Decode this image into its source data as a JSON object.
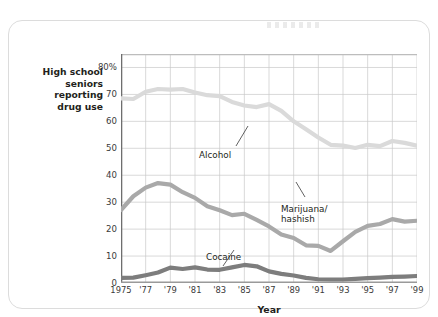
{
  "figure": {
    "y_axis_caption_lines": [
      "High school",
      "seniors",
      "reporting",
      "drug use"
    ],
    "x_axis_title": "Year"
  },
  "chart_data": {
    "type": "line",
    "title": "",
    "xlabel": "Year",
    "ylabel": "High school seniors reporting drug use",
    "xlim": [
      1975,
      1999
    ],
    "ylim": [
      0,
      85
    ],
    "grid": true,
    "legend": "inline-annotations",
    "ytick_labels": [
      "0",
      "10",
      "20",
      "30",
      "40",
      "50",
      "60",
      "70",
      "80%"
    ],
    "ytick_values": [
      0,
      10,
      20,
      30,
      40,
      50,
      60,
      70,
      80
    ],
    "xtick_labels": [
      "1975",
      "'77",
      "'79",
      "'81",
      "'83",
      "'85",
      "'87",
      "'89",
      "'91",
      "'93",
      "'95",
      "'97",
      "'99"
    ],
    "xtick_values": [
      1975,
      1977,
      1979,
      1981,
      1983,
      1985,
      1987,
      1989,
      1991,
      1993,
      1995,
      1997,
      1999
    ],
    "x": [
      1975,
      1976,
      1977,
      1978,
      1979,
      1980,
      1981,
      1982,
      1983,
      1984,
      1985,
      1986,
      1987,
      1988,
      1989,
      1990,
      1991,
      1992,
      1993,
      1994,
      1995,
      1996,
      1997,
      1998,
      1999
    ],
    "series": [
      {
        "name": "Alcohol",
        "color": "#dadada",
        "label_text": "Alcohol",
        "values": [
          68.5,
          68.3,
          71.0,
          72.0,
          71.8,
          72.0,
          70.7,
          69.7,
          69.4,
          67.2,
          65.9,
          65.3,
          66.4,
          63.9,
          60.0,
          57.1,
          54.0,
          51.3,
          51.0,
          50.1,
          51.3,
          50.8,
          52.7,
          52.0,
          51.0
        ]
      },
      {
        "name": "Marijuana/hashish",
        "color": "#a9a9a9",
        "label_text": "Marijuana/ hashish",
        "values": [
          27.1,
          32.2,
          35.4,
          37.1,
          36.5,
          33.7,
          31.6,
          28.5,
          27.0,
          25.2,
          25.7,
          23.4,
          21.0,
          18.0,
          16.7,
          14.0,
          13.8,
          11.9,
          15.5,
          19.0,
          21.2,
          21.9,
          23.7,
          22.8,
          23.1
        ]
      },
      {
        "name": "Cocaine",
        "color": "#7d7d7d",
        "label_text": "Cocaine",
        "values": [
          1.9,
          2.0,
          2.9,
          3.9,
          5.7,
          5.2,
          5.8,
          5.0,
          4.9,
          5.8,
          6.7,
          6.2,
          4.3,
          3.4,
          2.8,
          1.9,
          1.4,
          1.3,
          1.3,
          1.5,
          1.8,
          2.0,
          2.3,
          2.4,
          2.6
        ]
      }
    ],
    "annotations": [
      {
        "text": "Alcohol",
        "series": "Alcohol"
      },
      {
        "text": "Marijuana/",
        "series": "Marijuana/hashish"
      },
      {
        "text": "hashish",
        "series": "Marijuana/hashish"
      },
      {
        "text": "Cocaine",
        "series": "Cocaine"
      }
    ]
  }
}
